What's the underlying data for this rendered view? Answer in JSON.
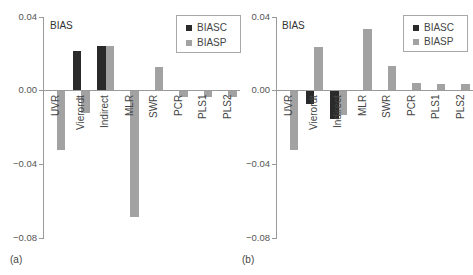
{
  "chart_data": [
    {
      "type": "bar",
      "panel_label": "(a)",
      "title": "BIAS",
      "xlabel": "",
      "ylabel": "",
      "categories": [
        "UVR",
        "Vierordt",
        "Indirect",
        "MLR",
        "SWR",
        "PCR",
        "PLS1",
        "PLS2"
      ],
      "series": [
        {
          "name": "BIASC",
          "color": "#2a2a2a",
          "values": [
            null,
            0.021,
            0.024,
            null,
            null,
            null,
            null,
            null
          ]
        },
        {
          "name": "BIASP",
          "color": "#a2a2a2",
          "values": [
            -0.032,
            -0.012,
            0.024,
            -0.068,
            0.0125,
            -0.003,
            -0.003,
            -0.003
          ]
        }
      ],
      "ylim": [
        -0.08,
        0.04
      ],
      "yticks": [
        "0.04",
        "0.00",
        "−0.04",
        "−0.08"
      ],
      "grid": false,
      "legend_position": "top-right"
    },
    {
      "type": "bar",
      "panel_label": "(b)",
      "title": "BIAS",
      "xlabel": "",
      "ylabel": "",
      "categories": [
        "UVR",
        "Vierordt",
        "Indirect",
        "MLR",
        "SWR",
        "PCR",
        "PLS1",
        "PLS2"
      ],
      "series": [
        {
          "name": "BIASC",
          "color": "#2a2a2a",
          "values": [
            null,
            -0.007,
            -0.015,
            null,
            null,
            null,
            null,
            null
          ]
        },
        {
          "name": "BIASP",
          "color": "#a2a2a2",
          "values": [
            -0.032,
            0.023,
            -0.013,
            0.033,
            0.013,
            0.004,
            0.0035,
            0.0035
          ]
        }
      ],
      "ylim": [
        -0.08,
        0.04
      ],
      "yticks": [
        "0.04",
        "0.00",
        "−0.04",
        "−0.08"
      ],
      "grid": false,
      "legend_position": "top-right"
    }
  ],
  "panels": [
    {
      "label": "(a)",
      "title": "BIAS",
      "legend": [
        "BIASC",
        "BIASP"
      ],
      "yticks": [
        "0.04",
        "0.00",
        "−0.04",
        "−0.08"
      ],
      "categories": [
        "UVR",
        "Vierordt",
        "Indirect",
        "MLR",
        "SWR",
        "PCR",
        "PLS1",
        "PLS2"
      ]
    },
    {
      "label": "(b)",
      "title": "BIAS",
      "legend": [
        "BIASC",
        "BIASP"
      ],
      "yticks": [
        "0.04",
        "0.00",
        "−0.04",
        "−0.08"
      ],
      "categories": [
        "UVR",
        "Vierordt",
        "Indirect",
        "MLR",
        "SWR",
        "PCR",
        "PLS1",
        "PLS2"
      ]
    }
  ]
}
